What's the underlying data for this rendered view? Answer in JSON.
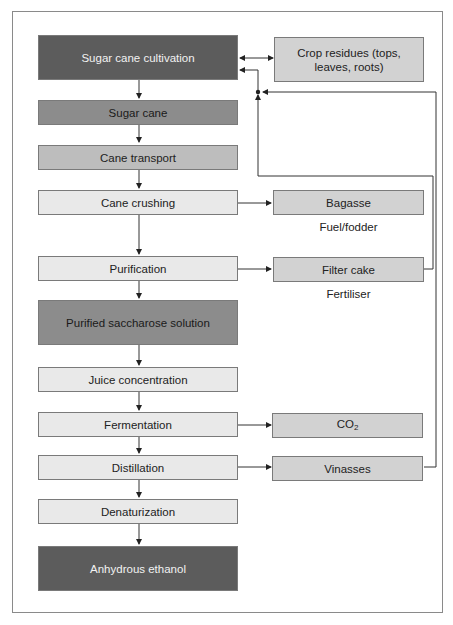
{
  "diagram": {
    "main_flow": [
      {
        "id": "cultivation",
        "label": "Sugar cane cultivation",
        "shade": "dark"
      },
      {
        "id": "sugar_cane",
        "label": "Sugar cane",
        "shade": "mid"
      },
      {
        "id": "transport",
        "label": "Cane transport",
        "shade": "midlight"
      },
      {
        "id": "crushing",
        "label": "Cane crushing",
        "shade": "light"
      },
      {
        "id": "purification",
        "label": "Purification",
        "shade": "light"
      },
      {
        "id": "saccharose",
        "label": "Purified saccharose solution",
        "shade": "mid"
      },
      {
        "id": "concentration",
        "label": "Juice concentration",
        "shade": "light"
      },
      {
        "id": "fermentation",
        "label": "Fermentation",
        "shade": "light"
      },
      {
        "id": "distillation",
        "label": "Distillation",
        "shade": "light"
      },
      {
        "id": "denaturization",
        "label": "Denaturization",
        "shade": "light"
      },
      {
        "id": "ethanol",
        "label": "Anhydrous ethanol",
        "shade": "dark"
      }
    ],
    "side_products": [
      {
        "id": "residues",
        "label": "Crop residues (tops, leaves, roots)",
        "from": "cultivation",
        "bidirectional": true
      },
      {
        "id": "bagasse",
        "label": "Bagasse",
        "from": "crushing",
        "note": "Fuel/fodder"
      },
      {
        "id": "filter_cake",
        "label": "Filter cake",
        "from": "purification",
        "note": "Fertiliser",
        "returns_to": "cultivation"
      },
      {
        "id": "co2",
        "label": "CO",
        "label_sub": "2",
        "from": "fermentation"
      },
      {
        "id": "vinasses",
        "label": "Vinasses",
        "from": "distillation",
        "returns_to": "cultivation"
      }
    ],
    "colors": {
      "dark": "#5c5c5c",
      "mid": "#8c8c8c",
      "midlight": "#bdbdbd",
      "light": "#e9e9e9",
      "side": "#d2d2d2",
      "line": "#333333"
    }
  }
}
